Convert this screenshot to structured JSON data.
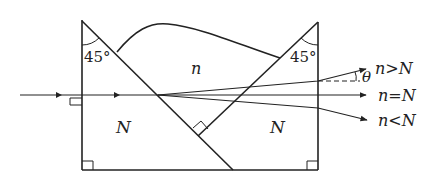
{
  "diagram": {
    "type": "optics-prism-assembly",
    "angles": {
      "left_apex": "45°",
      "right_apex": "45°"
    },
    "regions": {
      "middle_medium": "n",
      "left_prism": "N",
      "right_prism": "N"
    },
    "angle_symbol": "θ",
    "ray_labels": {
      "up": "n>N",
      "straight": "n=N",
      "down": "n<N"
    },
    "colors": {
      "line": "#222222",
      "background": "#ffffff"
    }
  }
}
